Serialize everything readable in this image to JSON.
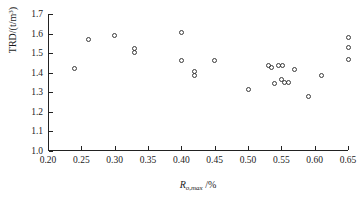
{
  "chart_data": {
    "type": "scatter",
    "title": "",
    "xlabel": "Ro,max /%",
    "ylabel": "TRD/(t/m3)",
    "xlim": [
      0.2,
      0.65
    ],
    "ylim": [
      1.0,
      1.7
    ],
    "grid": false,
    "legend": null,
    "marker": "open-circle",
    "xticks": [
      "0.20",
      "0.25",
      "0.30",
      "0.35",
      "0.40",
      "0.45",
      "0.50",
      "0.55",
      "0.60",
      "0.65"
    ],
    "xtick_values": [
      0.2,
      0.25,
      0.3,
      0.35,
      0.4,
      0.45,
      0.5,
      0.55,
      0.6,
      0.65
    ],
    "yticks": [
      "1.0",
      "1.1",
      "1.2",
      "1.3",
      "1.4",
      "1.5",
      "1.6",
      "1.7"
    ],
    "ytick_values": [
      1.0,
      1.1,
      1.2,
      1.3,
      1.4,
      1.5,
      1.6,
      1.7
    ],
    "x": [
      0.24,
      0.26,
      0.3,
      0.33,
      0.33,
      0.4,
      0.4,
      0.42,
      0.42,
      0.45,
      0.5,
      0.53,
      0.535,
      0.54,
      0.545,
      0.55,
      0.552,
      0.555,
      0.56,
      0.57,
      0.59,
      0.61,
      0.65,
      0.65,
      0.65
    ],
    "y": [
      1.422,
      1.57,
      1.592,
      1.525,
      1.505,
      1.605,
      1.463,
      1.405,
      1.385,
      1.463,
      1.316,
      1.435,
      1.428,
      1.345,
      1.437,
      1.365,
      1.437,
      1.352,
      1.352,
      1.415,
      1.278,
      1.388,
      1.578,
      1.53,
      1.468
    ],
    "points": [
      {
        "x": 0.24,
        "y": 1.422
      },
      {
        "x": 0.26,
        "y": 1.57
      },
      {
        "x": 0.3,
        "y": 1.592
      },
      {
        "x": 0.33,
        "y": 1.525
      },
      {
        "x": 0.33,
        "y": 1.505
      },
      {
        "x": 0.4,
        "y": 1.605
      },
      {
        "x": 0.4,
        "y": 1.463
      },
      {
        "x": 0.42,
        "y": 1.405
      },
      {
        "x": 0.42,
        "y": 1.385
      },
      {
        "x": 0.45,
        "y": 1.463
      },
      {
        "x": 0.5,
        "y": 1.316
      },
      {
        "x": 0.53,
        "y": 1.435
      },
      {
        "x": 0.535,
        "y": 1.428
      },
      {
        "x": 0.54,
        "y": 1.345
      },
      {
        "x": 0.545,
        "y": 1.437
      },
      {
        "x": 0.55,
        "y": 1.365
      },
      {
        "x": 0.552,
        "y": 1.437
      },
      {
        "x": 0.555,
        "y": 1.352
      },
      {
        "x": 0.56,
        "y": 1.352
      },
      {
        "x": 0.57,
        "y": 1.415
      },
      {
        "x": 0.59,
        "y": 1.278
      },
      {
        "x": 0.61,
        "y": 1.388
      },
      {
        "x": 0.65,
        "y": 1.578
      },
      {
        "x": 0.65,
        "y": 1.53
      },
      {
        "x": 0.65,
        "y": 1.468
      }
    ],
    "n_points": 25,
    "colors": {
      "marker_stroke": "#3a3a3a",
      "axis": "#222222",
      "background": "#ffffff"
    }
  },
  "axis_titles": {
    "x_main": "R",
    "x_sub": "o,max",
    "x_unit": " /%",
    "y_main": "TRD/(t/m",
    "y_sup": "3",
    "y_close": ")"
  }
}
